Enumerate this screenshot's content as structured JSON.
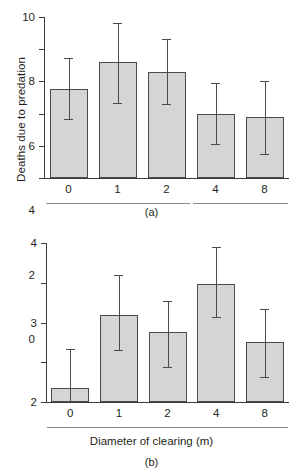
{
  "figure": {
    "panels": [
      {
        "id": "a",
        "caption": "(a)",
        "ylabel": "Deaths due to predation",
        "xlabel": "",
        "ytick_labels": [
          "0",
          "2",
          "4",
          "6",
          "8",
          "10"
        ],
        "xtick_labels": [
          "0",
          "1",
          "2",
          "4",
          "8"
        ]
      },
      {
        "id": "b",
        "caption": "(b)",
        "ylabel": "Deaths due to heat stress",
        "xlabel": "Diameter of clearing (m)",
        "ytick_labels": [
          "0",
          "1",
          "2",
          "3",
          "4"
        ],
        "xtick_labels": [
          "0",
          "1",
          "2",
          "4",
          "8"
        ]
      }
    ]
  },
  "style": {
    "bar_fill": "#d5d5d5",
    "bar_stroke": "#4a4a4a",
    "axis_color": "#3b3b3b",
    "group_line_color": "#8a8a8a",
    "text_color": "#231f20"
  },
  "chart_data": [
    {
      "type": "bar",
      "panel": "a",
      "title": "",
      "xlabel": "",
      "ylabel": "Deaths due to predation",
      "categories": [
        "0",
        "1",
        "2",
        "4",
        "8"
      ],
      "values": [
        5.5,
        7.2,
        6.6,
        4.0,
        3.8
      ],
      "error_low": [
        3.65,
        4.65,
        4.6,
        2.1,
        1.5
      ],
      "error_high": [
        7.45,
        9.6,
        8.65,
        5.9,
        6.05
      ],
      "error_type": "asymmetric-range",
      "ylim": [
        0,
        10
      ],
      "ytick_step": 2,
      "yticks": [
        0,
        2,
        4,
        6,
        8,
        10
      ],
      "grid": false,
      "legend": "none",
      "group_underlines": [
        [
          "0",
          "1",
          "2"
        ],
        [
          "4",
          "8"
        ]
      ]
    },
    {
      "type": "bar",
      "panel": "b",
      "title": "",
      "xlabel": "Diameter of clearing (m)",
      "ylabel": "Deaths due to heat stress",
      "categories": [
        "0",
        "1",
        "2",
        "4",
        "8"
      ],
      "values": [
        0.35,
        2.2,
        1.75,
        2.97,
        1.5
      ],
      "error_low": [
        0.0,
        1.3,
        0.87,
        2.13,
        0.62
      ],
      "error_high": [
        1.33,
        3.2,
        2.55,
        3.9,
        2.33
      ],
      "error_type": "asymmetric-range",
      "ylim": [
        0,
        4
      ],
      "ytick_step": 1,
      "yticks": [
        0,
        1,
        2,
        3,
        4
      ],
      "grid": false,
      "legend": "none",
      "group_underlines": [
        [
          "0",
          "1",
          "2",
          "4",
          "8"
        ]
      ]
    }
  ]
}
